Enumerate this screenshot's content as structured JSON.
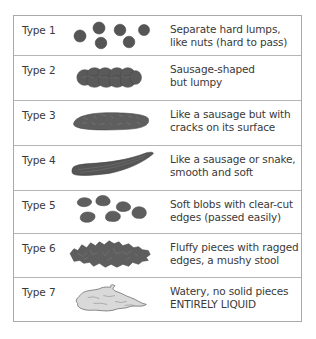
{
  "chart": {
    "colors": {
      "border": "#a9a9a9",
      "stool_dark": "#5a5a5a",
      "stool_outline": "#444444",
      "liquid_fill": "#d9d9d9",
      "liquid_outline": "#6a6a6a",
      "text": "#3a3a3a"
    },
    "rows": [
      {
        "label": "Type 1",
        "illustration": "separate-hard-lumps",
        "line1": "Separate hard lumps,",
        "line2": "like nuts (hard to pass)"
      },
      {
        "label": "Type 2",
        "illustration": "lumpy-sausage",
        "line1": "Sausage-shaped",
        "line2": "but lumpy"
      },
      {
        "label": "Type 3",
        "illustration": "cracked-sausage",
        "line1": "Like a sausage but with",
        "line2": "cracks on its surface"
      },
      {
        "label": "Type 4",
        "illustration": "smooth-snake",
        "line1": "Like a sausage or snake,",
        "line2": "smooth and soft"
      },
      {
        "label": "Type 5",
        "illustration": "soft-blobs",
        "line1": "Soft blobs with clear-cut",
        "line2": "edges (passed easily)"
      },
      {
        "label": "Type 6",
        "illustration": "fluffy-pieces",
        "line1": "Fluffy pieces with ragged",
        "line2": "edges, a mushy stool"
      },
      {
        "label": "Type 7",
        "illustration": "watery-liquid",
        "line1": "Watery, no solid pieces",
        "line2": "ENTIRELY LIQUID"
      }
    ]
  }
}
